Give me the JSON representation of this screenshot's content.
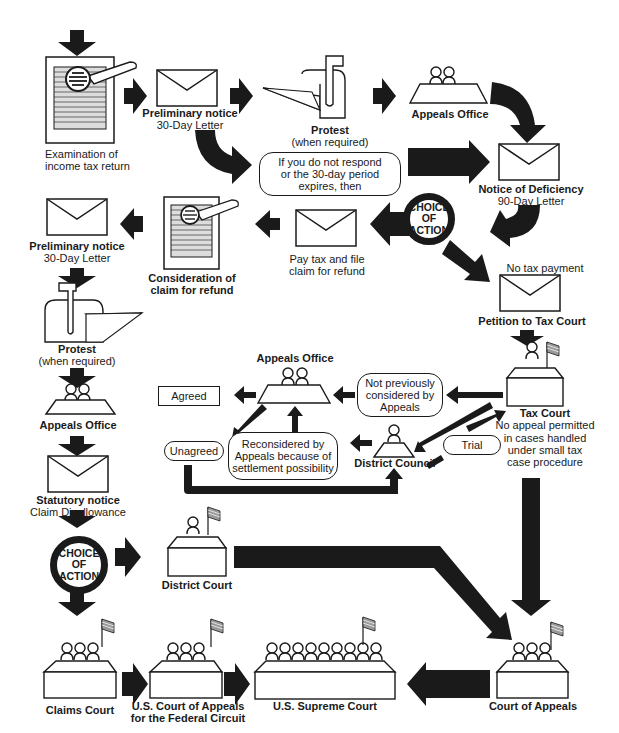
{
  "colors": {
    "ink": "#1a1a1a",
    "paper": "#ffffff"
  },
  "icons": {
    "document": "document-with-magnifier-icon",
    "envelope": "envelope-icon",
    "mailbox": "mailbox-icon",
    "appeals": "appeals-office-table-icon",
    "court": "court-bench-icon",
    "flag": "flag-icon"
  },
  "nodes": {
    "examination": {
      "line1": "Examination of",
      "line2": "income tax return"
    },
    "prelim_top": {
      "title": "Preliminary notice",
      "sub": "30-Day Letter"
    },
    "protest_top": {
      "title": "Protest",
      "sub": "(when required)"
    },
    "appeals_top": {
      "title": "Appeals Office"
    },
    "no_response": {
      "line1": "If you do not respond",
      "line2": "or the 30-day period",
      "line3": "expires, then"
    },
    "deficiency": {
      "title": "Notice of Deficiency",
      "sub": "90-Day Letter"
    },
    "choice1": {
      "line1": "CHOICE",
      "line2": "OF",
      "line3": "ACTION"
    },
    "pay_tax": {
      "line1": "Pay tax and file",
      "line2": "claim for refund"
    },
    "no_tax": {
      "label": "No tax payment"
    },
    "petition": {
      "title": "Petition to Tax Court"
    },
    "refund_claim": {
      "line1": "Consideration of",
      "line2": "claim for refund"
    },
    "prelim_left": {
      "title": "Preliminary notice",
      "sub": "30-Day Letter"
    },
    "protest_left": {
      "title": "Protest",
      "sub": "(when required)"
    },
    "appeals_left": {
      "title": "Appeals Office"
    },
    "statutory": {
      "title": "Statutory notice",
      "sub": "Claim Disallowance"
    },
    "choice2": {
      "line1": "CHOICE",
      "line2": "OF",
      "line3": "ACTION"
    },
    "appeals_mid": {
      "title": "Appeals Office"
    },
    "agreed": {
      "label": "Agreed"
    },
    "unagreed": {
      "label": "Unagreed"
    },
    "not_prev": {
      "line1": "Not previously",
      "line2": "considered by",
      "line3": "Appeals"
    },
    "reconsidered": {
      "line1": "Reconsidered by",
      "line2": "Appeals because of",
      "line3": "settlement possibility"
    },
    "district_council": {
      "title": "District Council"
    },
    "trial": {
      "label": "Trial"
    },
    "tax_court": {
      "title": "Tax Court",
      "line1": "No appeal permitted",
      "line2": "in cases handled",
      "line3": "under small tax",
      "line4": "case procedure"
    },
    "district_court": {
      "title": "District Court"
    },
    "claims_court": {
      "title": "Claims Court"
    },
    "fed_circuit": {
      "line1": "U.S. Court of Appeals",
      "line2": "for the Federal Circuit"
    },
    "supreme": {
      "title": "U.S. Supreme Court"
    },
    "court_appeals": {
      "title": "Court of Appeals"
    }
  }
}
